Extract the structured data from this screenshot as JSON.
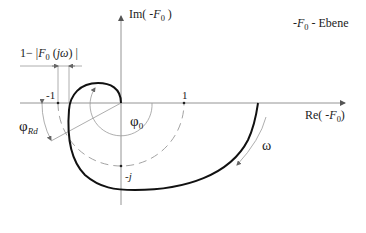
{
  "diagram": {
    "plane_label": {
      "prefix": "-",
      "var": "F",
      "sub": "0",
      "suffix": " - Ebene"
    },
    "axes": {
      "im_label": {
        "prefix": "Im( -",
        "var": "F",
        "sub": "0",
        "suffix": " )"
      },
      "re_label": {
        "prefix": "Re( -",
        "var": "F",
        "sub": "0",
        "suffix": ")"
      }
    },
    "ticks": {
      "minus_one": "-1",
      "one": "1",
      "minus_j": "-j"
    },
    "annotations": {
      "gain_margin": {
        "text_a": "1− |",
        "var": "F",
        "sub": "0",
        "text_b": " (",
        "arg": "jω",
        "text_c": ") |"
      },
      "phi_0": {
        "sym": "φ",
        "sub": "0"
      },
      "phi_rd": {
        "sym": "φ",
        "sub": "Rd"
      },
      "omega": "ω"
    },
    "colors": {
      "curve": "#111111",
      "axis": "#777777",
      "dashed_circle": "#888888",
      "annotation": "#888888",
      "text": "#222222"
    }
  }
}
